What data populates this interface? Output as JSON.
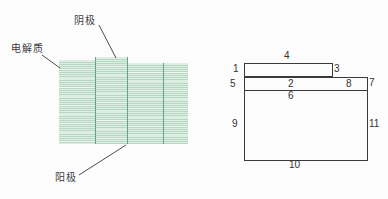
{
  "figure": {
    "background": "#fcfcfc",
    "text_color": "#3c3c3c",
    "left": {
      "type": "layered-structure-striped-photo",
      "labels": {
        "cathode": "阴极",
        "electrolyte": "电解质",
        "anode": "阳极"
      },
      "colors": {
        "stripe_dark": "#b7d7c3",
        "stripe_light": "#ddeee3",
        "layer_divider": "#6ba287",
        "leader_line": "#4d4d4d"
      }
    },
    "right": {
      "type": "numbered-outline-schematic",
      "numbers": [
        "1",
        "2",
        "3",
        "4",
        "5",
        "6",
        "7",
        "8",
        "9",
        "10",
        "11"
      ],
      "line_color": "#3a3a3a"
    }
  }
}
